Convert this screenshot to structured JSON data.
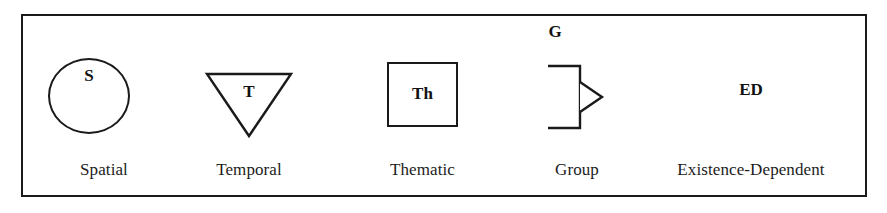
{
  "figure": {
    "type": "legend",
    "background_color": "#ffffff",
    "line_color": "#1a1a1a",
    "text_color": "#1c1c1c",
    "border": {
      "visible": true,
      "width_px": 2
    }
  },
  "legend": {
    "items": [
      {
        "abbr": "S",
        "label": "Spatial",
        "symbol": "ellipse-icon",
        "abbr_position": "inside-top"
      },
      {
        "abbr": "T",
        "label": "Temporal",
        "symbol": "inverted-triangle-icon",
        "abbr_position": "inside-top"
      },
      {
        "abbr": "Th",
        "label": "Thematic",
        "symbol": "square-icon",
        "abbr_position": "inside-center"
      },
      {
        "abbr": "G",
        "label": "Group",
        "symbol": "bracket-arrow-icon",
        "abbr_position": "above"
      },
      {
        "abbr": "ED",
        "label": "Existence-Dependent",
        "symbol": "none",
        "abbr_position": "standalone"
      }
    ]
  }
}
